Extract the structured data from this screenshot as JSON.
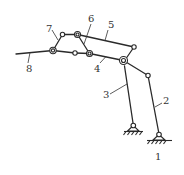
{
  "diagram": {
    "type": "planar-linkage-mechanism",
    "stroke_color": "#2a2a2a",
    "background": "#ffffff",
    "labels": [
      {
        "id": "1",
        "text": "1",
        "x": 155,
        "y": 160
      },
      {
        "id": "2",
        "text": "2",
        "x": 163,
        "y": 104
      },
      {
        "id": "3",
        "text": "3",
        "x": 103,
        "y": 98
      },
      {
        "id": "4",
        "text": "4",
        "x": 94,
        "y": 72
      },
      {
        "id": "5",
        "text": "5",
        "x": 108,
        "y": 28
      },
      {
        "id": "6",
        "text": "6",
        "x": 88,
        "y": 22
      },
      {
        "id": "7",
        "text": "7",
        "x": 46,
        "y": 32
      },
      {
        "id": "8",
        "text": "8",
        "x": 26,
        "y": 72
      }
    ]
  }
}
